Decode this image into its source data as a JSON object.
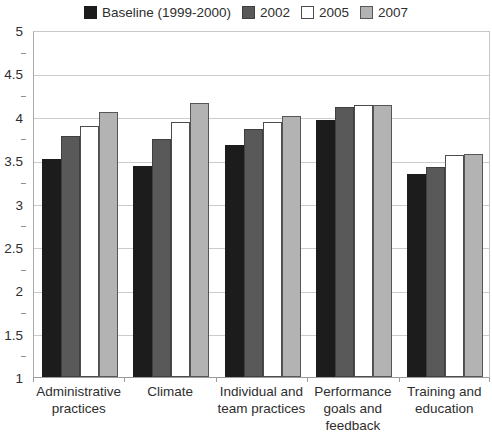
{
  "figure": {
    "background": "#ffffff",
    "text_color": "#2e2e2e",
    "gridline_color": "#cccccc",
    "axis_color": "#9b9b9b"
  },
  "chart_data": {
    "type": "bar",
    "title": "",
    "xlabel": "",
    "ylabel": "",
    "categories": [
      "Administrative\npractices",
      "Climate",
      "Individual and\nteam practices",
      "Performance\ngoals and\nfeedback",
      "Training and\neducation"
    ],
    "series": [
      {
        "name": "Baseline (1999-2000)",
        "color": "#1c1c1c",
        "border_color": "#1c1c1c",
        "values": [
          3.51,
          3.43,
          3.68,
          3.96,
          3.34
        ]
      },
      {
        "name": "2002",
        "color": "#595959",
        "border_color": "#3f3f3f",
        "values": [
          3.78,
          3.74,
          3.86,
          4.11,
          3.42
        ]
      },
      {
        "name": "2005",
        "color": "#ffffff",
        "border_color": "#4d4d4d",
        "values": [
          3.89,
          3.94,
          3.94,
          4.13,
          3.56
        ]
      },
      {
        "name": "2007",
        "color": "#b3b3b3",
        "border_color": "#565656",
        "values": [
          4.05,
          4.16,
          4.01,
          4.13,
          3.57
        ]
      }
    ],
    "ylim": [
      1,
      5
    ],
    "ytick_step": 0.5,
    "grid": true,
    "legend_position": "top"
  }
}
